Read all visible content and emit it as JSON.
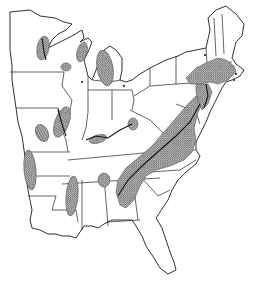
{
  "map": {
    "title": "Eastern United States distribution map",
    "region": "Eastern United States",
    "style": "black-and-white line map with hatched shaded areas",
    "colors": {
      "background": "#ffffff",
      "outline": "#1a1a1a",
      "shade": "#8a8a8a"
    },
    "shaded_regions": [
      "Northwestern Wisconsin / Mississippi headwaters",
      "Northeastern Wisconsin (Green Bay)",
      "Central Wisconsin",
      "Lower Michigan",
      "Eastern Iowa / Mississippi river corridor",
      "Northern Missouri",
      "Southern Illinois / Indiana (Ohio River)",
      "Southern Ohio",
      "Appalachians: Pennsylvania to Georgia",
      "New England coastal: Massachusetts, Connecticut, Rhode Island",
      "Eastern Arkansas",
      "Mississippi Delta",
      "Northern Alabama"
    ],
    "caption": "",
    "credit": ""
  }
}
